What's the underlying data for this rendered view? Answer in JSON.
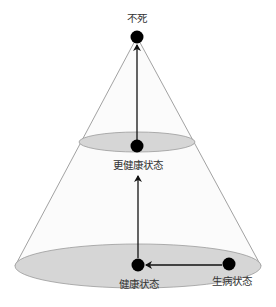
{
  "diagram": {
    "type": "cone-state-diagram",
    "colors": {
      "background": "#ffffff",
      "cone_edge": "#8a8a8a",
      "cone_fill": "#fbfbfb",
      "ellipse_fill": "#d6d6d6",
      "ellipse_stroke": "#9a9a9a",
      "node": "#000000",
      "arrow": "#111111",
      "label": "#333333"
    },
    "nodes": [
      {
        "id": "immortal",
        "label": "不死",
        "x": 137,
        "y": 37
      },
      {
        "id": "healthier",
        "label": "更健康状态",
        "x": 137,
        "y": 146
      },
      {
        "id": "healthy",
        "label": "健康状态",
        "x": 138,
        "y": 265
      },
      {
        "id": "sick",
        "label": "生病状态",
        "x": 229,
        "y": 264
      }
    ],
    "edges": [
      {
        "from": "sick",
        "to": "healthy"
      },
      {
        "from": "healthy",
        "to": "healthier"
      },
      {
        "from": "healthier",
        "to": "immortal"
      }
    ],
    "levels": [
      {
        "name": "middle-ellipse",
        "cx": 137,
        "cy": 142,
        "rx": 58,
        "ry": 10
      },
      {
        "name": "base-ellipse",
        "cx": 138,
        "cy": 266,
        "rx": 123,
        "ry": 22
      }
    ]
  }
}
